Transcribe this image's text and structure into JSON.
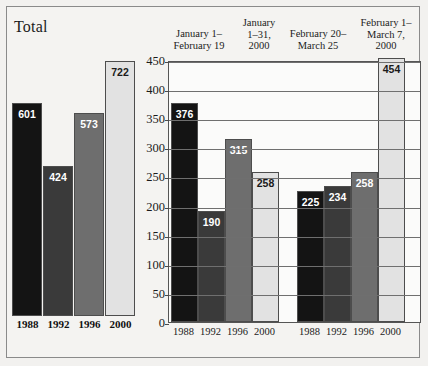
{
  "figure": {
    "background_color": "#f2f1ef",
    "frame_color": "#8a8a8a"
  },
  "series_colors": {
    "1988": "#141414",
    "1992": "#3a3a3a",
    "1996": "#6e6e6e",
    "2000": "#e2e2e2"
  },
  "total_panel": {
    "title": "Total",
    "categories": [
      "1988",
      "1992",
      "1996",
      "2000"
    ],
    "values": [
      601,
      424,
      573,
      722
    ]
  },
  "main_panel": {
    "period_headers": [
      "January 1–\nFebruary 19",
      "January\n1–31,\n2000",
      "February 20–\nMarch 25",
      "February 1–\nMarch 7,\n2000"
    ],
    "y_ticks": [
      "0",
      "50",
      "100",
      "150",
      "200",
      "250",
      "300",
      "350",
      "400",
      "450"
    ],
    "x_labels": [
      "1988",
      "1992",
      "1996",
      "2000",
      "1988",
      "1992",
      "1996",
      "2000"
    ]
  },
  "chart_data": {
    "type": "bar",
    "title": "",
    "panels": [
      {
        "name": "Total",
        "type": "bar",
        "categories": [
          "1988",
          "1992",
          "1996",
          "2000"
        ],
        "values": [
          601,
          424,
          573,
          722
        ],
        "ylim": [
          0,
          780
        ],
        "grid": false,
        "data_labels": [
          "601",
          "424",
          "573",
          "722"
        ]
      },
      {
        "name": "Periods",
        "type": "bar",
        "categories": [
          "1988",
          "1992",
          "1996",
          "2000",
          "1988",
          "1992",
          "1996",
          "2000"
        ],
        "values": [
          376,
          190,
          315,
          258,
          225,
          234,
          258,
          454
        ],
        "data_labels": [
          "376",
          "190",
          "315",
          "258",
          "225",
          "234",
          "258",
          "454"
        ],
        "ylim": [
          0,
          450
        ],
        "ytick_step": 50,
        "grid": true,
        "xlabel": "",
        "ylabel": "",
        "groups": [
          {
            "label": "January 1–February 19",
            "bars": [
              {
                "category": "1988",
                "value": 376
              },
              {
                "category": "1992",
                "value": 190
              }
            ]
          },
          {
            "label": "January 1–31, 2000",
            "bars": [
              {
                "category": "1996",
                "value": 315
              },
              {
                "category": "2000",
                "value": 258
              }
            ]
          },
          {
            "label": "February 20–March 25",
            "bars": [
              {
                "category": "1988",
                "value": 225
              },
              {
                "category": "1992",
                "value": 234
              }
            ]
          },
          {
            "label": "February 1–March 7, 2000",
            "bars": [
              {
                "category": "1996",
                "value": 258
              },
              {
                "category": "2000",
                "value": 454
              }
            ]
          }
        ]
      }
    ],
    "legend": {
      "entries": [
        "1988",
        "1992",
        "1996",
        "2000"
      ],
      "position": "x-axis"
    }
  }
}
